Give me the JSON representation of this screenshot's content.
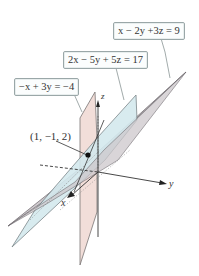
{
  "diagram": {
    "planes": [
      {
        "id": "plane-gray",
        "equation": "x − 2y +3z = 9",
        "fill": "#cdc8cc",
        "stroke": "#6e6a6e"
      },
      {
        "id": "plane-blue",
        "equation": "2x − 5y + 5z = 17",
        "fill": "#d4e9ee",
        "stroke": "#6e7a7e"
      },
      {
        "id": "plane-pink",
        "equation": "−x + 3y = −4",
        "fill": "#f1dcd6",
        "stroke": "#6e6a6a"
      }
    ],
    "axes": {
      "x": "x",
      "y": "y",
      "z": "z"
    },
    "point": {
      "label": "(1, −1, 2)",
      "color": "#111111"
    }
  }
}
